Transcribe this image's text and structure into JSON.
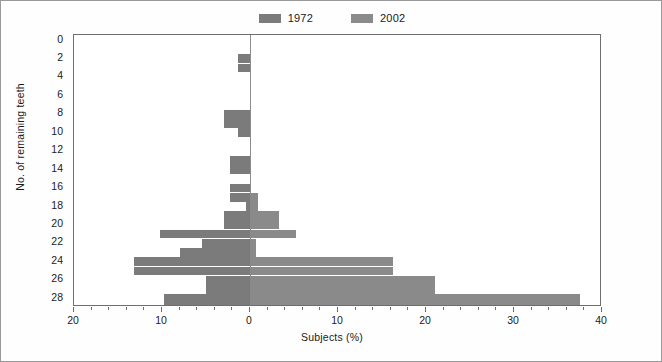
{
  "legend": {
    "position": "top-center",
    "entries": [
      {
        "label": "1972",
        "color": "#7b7b7b",
        "side": "left"
      },
      {
        "label": "2002",
        "color": "#8a8a8a",
        "side": "right"
      }
    ]
  },
  "axes": {
    "y": {
      "title": "No. of remaining teeth",
      "ticks": [
        0,
        2,
        4,
        6,
        8,
        10,
        12,
        14,
        16,
        18,
        20,
        22,
        24,
        26,
        28
      ],
      "range": [
        0,
        29.5
      ]
    },
    "x": {
      "title": "Subjects (%)",
      "tick_labels": [
        "20",
        "10",
        "0",
        "10",
        "20",
        "30",
        "40"
      ],
      "tick_values": [
        -20,
        -10,
        0,
        10,
        20,
        30,
        40
      ],
      "minor_step": 2,
      "left_max": 20,
      "right_max": 40
    }
  },
  "chart_data": {
    "type": "bar",
    "orientation": "horizontal",
    "subtype": "back-to-back population pyramid",
    "title": "",
    "xlabel": "Subjects (%)",
    "ylabel": "No. of remaining teeth",
    "xlim": [
      -20,
      40
    ],
    "ylim": [
      0,
      29.5
    ],
    "grid": false,
    "legend_position": "top-center",
    "categories": [
      0,
      1,
      2,
      3,
      4,
      5,
      6,
      7,
      8,
      9,
      10,
      11,
      12,
      13,
      14,
      15,
      16,
      17,
      18,
      19,
      20,
      21,
      22,
      23,
      24,
      25,
      26,
      27,
      28,
      29
    ],
    "series": [
      {
        "name": "1972",
        "color": "#7b7b7b",
        "direction": "left",
        "values": [
          0,
          0,
          1.4,
          1.4,
          0,
          0,
          0,
          0,
          2.9,
          2.9,
          1.4,
          0,
          0,
          2.3,
          2.3,
          0,
          2.3,
          2.3,
          0.4,
          3.0,
          3.0,
          10.2,
          5.5,
          8.0,
          13.2,
          13.2,
          5.0,
          5.0,
          9.8,
          9.8
        ]
      },
      {
        "name": "2002",
        "color": "#8a8a8a",
        "direction": "right",
        "values": [
          0,
          0,
          0,
          0,
          0,
          0,
          0,
          0,
          0,
          0,
          0,
          0,
          0,
          0,
          0,
          0,
          0,
          0.9,
          0.9,
          3.3,
          3.3,
          5.2,
          0.7,
          0.7,
          16.2,
          16.2,
          21.0,
          21.0,
          37.5,
          37.5
        ]
      }
    ]
  }
}
